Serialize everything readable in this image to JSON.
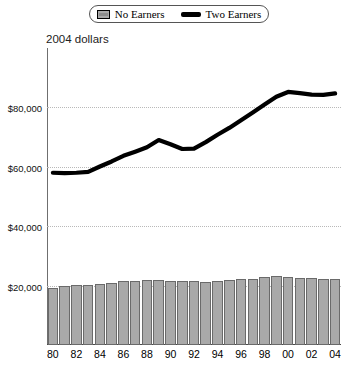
{
  "legend": {
    "position": "top-center",
    "entries": [
      {
        "label": "No Earners",
        "marker": "bar-swatch-icon",
        "color": "#a9a9a9"
      },
      {
        "label": "Two Earners",
        "marker": "line-swatch-icon",
        "color": "#000000"
      }
    ]
  },
  "axis_title": "2004 dollars",
  "chart_data": {
    "type": "bar",
    "title": "",
    "subtitle": "",
    "xlabel": "",
    "ylabel": "2004 dollars",
    "ylim": [
      0,
      100000
    ],
    "grid": true,
    "legend_position": "top-center",
    "ytick_values": [
      20000,
      40000,
      60000,
      80000
    ],
    "ytick_labels": [
      "$20,000",
      "$40,000",
      "$60,000",
      "$80,000"
    ],
    "categories": [
      "80",
      "81",
      "82",
      "83",
      "84",
      "85",
      "86",
      "87",
      "88",
      "89",
      "90",
      "91",
      "92",
      "93",
      "94",
      "95",
      "96",
      "97",
      "98",
      "99",
      "00",
      "01",
      "02",
      "03",
      "04"
    ],
    "xtick_labels_shown": [
      "80",
      "82",
      "84",
      "86",
      "88",
      "90",
      "92",
      "94",
      "96",
      "98",
      "00",
      "02",
      "04"
    ],
    "series": [
      {
        "name": "No Earners",
        "type": "bar",
        "color": "#a9a9a9",
        "values": [
          19300,
          19900,
          20100,
          20200,
          20600,
          20900,
          21500,
          21600,
          21900,
          21900,
          21700,
          21500,
          21500,
          21300,
          21400,
          21800,
          22300,
          22300,
          22900,
          23400,
          22800,
          22500,
          22400,
          22300,
          22200
        ]
      },
      {
        "name": "Two Earners",
        "type": "line",
        "color": "#000000",
        "values": [
          58000,
          57900,
          58000,
          58300,
          60100,
          61800,
          63700,
          65100,
          66600,
          69000,
          67600,
          66000,
          66100,
          68300,
          70800,
          73100,
          75700,
          78300,
          81000,
          83600,
          85200,
          84800,
          84300,
          84200,
          84700
        ]
      }
    ]
  }
}
